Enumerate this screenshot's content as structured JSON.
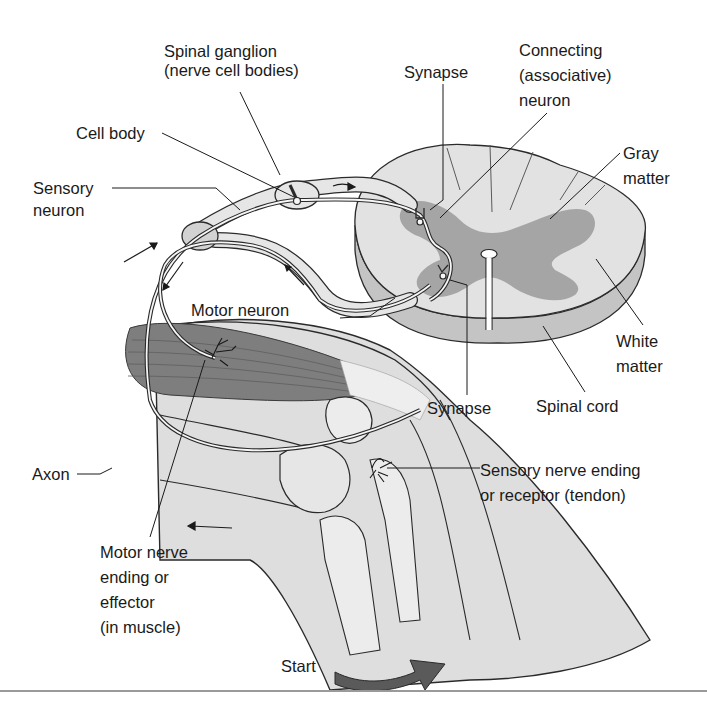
{
  "figure": {
    "colors": {
      "background": "#ffffff",
      "white_matter": "#e2e2e2",
      "white_matter_edge": "#bdbdbd",
      "gray_matter": "#9a9a9a",
      "muscle": "#7e7e7e",
      "leg": "#dcdcdc",
      "bone": "#ececec",
      "nerve_fill": "#f2f2f2",
      "outline": "#2a2a2a",
      "start_arrow": "#5a5a5a",
      "rule": "#9a9a9a"
    }
  },
  "labels": {
    "spinal_ganglion": [
      "Spinal ganglion",
      "(nerve cell bodies)"
    ],
    "cell_body": [
      "Cell body"
    ],
    "sensory_neuron": [
      "Sensory",
      "neuron"
    ],
    "synapse_top": [
      "Synapse"
    ],
    "connecting_neuron": [
      "Connecting",
      "(associative)",
      "neuron"
    ],
    "gray_matter": [
      "Gray",
      "matter"
    ],
    "motor_neuron": [
      "Motor neuron"
    ],
    "white_matter": [
      "White",
      "matter"
    ],
    "synapse_bottom": [
      "Synapse"
    ],
    "spinal_cord": [
      "Spinal cord"
    ],
    "axon": [
      "Axon"
    ],
    "sensory_nerve_ending": [
      "Sensory nerve ending",
      "or receptor (tendon)"
    ],
    "motor_nerve_ending": [
      "Motor nerve",
      "ending or",
      "effector",
      "(in muscle)"
    ],
    "start": [
      "Start"
    ]
  }
}
